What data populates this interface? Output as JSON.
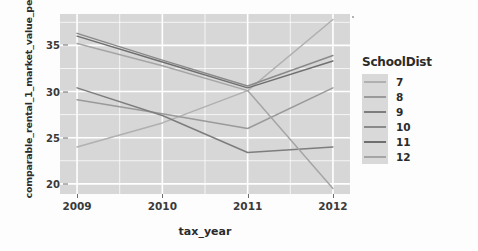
{
  "chart_data": {
    "type": "line",
    "title": "",
    "xlabel": "tax_year",
    "ylabel": "comparable_rental_1_market_value_per_sqft",
    "x": [
      2009,
      2010,
      2011,
      2012
    ],
    "xtick_labels": [
      "2009",
      "2010",
      "2011",
      "2012"
    ],
    "ytick_labels": [
      "20",
      "25",
      "30",
      "35"
    ],
    "yticks": [
      20,
      25,
      30,
      35
    ],
    "xlim": [
      2008.8,
      2012.2
    ],
    "ylim": [
      18.9,
      38.4
    ],
    "grid": true,
    "legend_position": "right",
    "legend_title": "SchoolDist",
    "panel_background": "#d7d7d7",
    "grid_color": "#ffffff",
    "series": [
      {
        "name": "7",
        "color": "#b0b0b0",
        "values": [
          24.0,
          26.6,
          30.1,
          37.8
        ]
      },
      {
        "name": "8",
        "color": "#9a9a9a",
        "values": [
          29.1,
          27.6,
          26.0,
          30.4
        ]
      },
      {
        "name": "9",
        "color": "#7d7d7d",
        "values": [
          30.4,
          27.4,
          23.4,
          24.0
        ]
      },
      {
        "name": "10",
        "color": "#8a8a8a",
        "values": [
          36.3,
          33.4,
          30.6,
          33.9
        ]
      },
      {
        "name": "11",
        "color": "#6f6f6f",
        "values": [
          36.0,
          33.2,
          30.4,
          33.3
        ]
      },
      {
        "name": "12",
        "color": "#a5a5a5",
        "values": [
          35.2,
          32.8,
          30.1,
          19.5
        ]
      }
    ]
  },
  "legend": {
    "title": "SchoolDist",
    "items": [
      {
        "label": "7"
      },
      {
        "label": "8"
      },
      {
        "label": "9"
      },
      {
        "label": "10"
      },
      {
        "label": "11"
      },
      {
        "label": "12"
      }
    ]
  },
  "axes": {
    "x_title": "tax_year",
    "y_title": "comparable_rental_1_market_value_per_sqft"
  }
}
